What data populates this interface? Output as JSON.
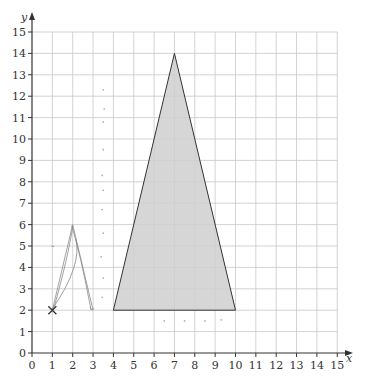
{
  "diagram": {
    "type": "coordinate_grid",
    "axes": {
      "x_label": "x",
      "y_label": "y",
      "x_range": [
        0,
        15
      ],
      "y_range": [
        0,
        15
      ],
      "x_ticks": [
        "0",
        "1",
        "2",
        "3",
        "4",
        "5",
        "6",
        "7",
        "8",
        "9",
        "10",
        "11",
        "12",
        "13",
        "14",
        "15"
      ],
      "y_ticks": [
        "0",
        "1",
        "2",
        "3",
        "4",
        "5",
        "6",
        "7",
        "8",
        "9",
        "10",
        "11",
        "12",
        "13",
        "14",
        "15"
      ],
      "grid": true
    },
    "shapes": [
      {
        "name": "shaded-triangle",
        "vertices": [
          [
            4,
            2
          ],
          [
            10,
            2
          ],
          [
            7,
            14
          ]
        ],
        "fill": "#cfcfcf",
        "stroke": "#333333"
      }
    ],
    "pencil_sketch": {
      "description": "faint hand-drawn small triangle with cross mark",
      "cross_mark": [
        1,
        2
      ],
      "apex": [
        2,
        6
      ],
      "base_right": [
        3,
        2
      ],
      "color": "#8a8a8a"
    },
    "colors": {
      "grid": "#c8c8c8",
      "axis": "#333333",
      "triangle_fill": "#cfcfcf",
      "triangle_stroke": "#333333"
    }
  }
}
